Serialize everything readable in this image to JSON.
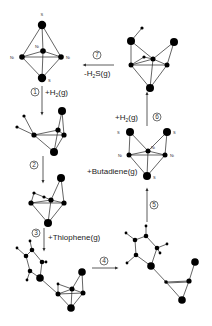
{
  "diagram": {
    "colors": {
      "atom": "#000000",
      "bond": "#222222",
      "text": "#222222",
      "background": "#ffffff"
    },
    "steps": [
      {
        "id": 1,
        "number": "1",
        "reagent": "+H",
        "sub": "2",
        "suffix": "(g)",
        "direction": "down"
      },
      {
        "id": 2,
        "number": "2",
        "reagent": "",
        "sub": "",
        "suffix": "",
        "direction": "down"
      },
      {
        "id": 3,
        "number": "3",
        "reagent": "+Thiophene(g)",
        "sub": "",
        "suffix": "",
        "direction": "down"
      },
      {
        "id": 4,
        "number": "4",
        "reagent": "",
        "sub": "",
        "suffix": "",
        "direction": "right"
      },
      {
        "id": 5,
        "number": "5",
        "reagent": "",
        "sub": "",
        "suffix": "",
        "direction": "up"
      },
      {
        "id": 6,
        "number": "6",
        "reagent": "+H",
        "sub": "2",
        "suffix": "(g)",
        "direction": "up"
      },
      {
        "id": 7,
        "number": "7",
        "reagent": "-H",
        "sub": "2",
        "suffix": "S(g)",
        "direction": "left"
      }
    ],
    "side_label": {
      "text": "+Butadiene(g)"
    },
    "structures": [
      {
        "name": "Ni3S2 initial cluster",
        "atom_labels": [
          "S",
          "Ni",
          "Ni",
          "Ni",
          "S"
        ]
      },
      {
        "name": "Ni3S2 with H2 adsorbed (after step 1)",
        "atom_labels": []
      },
      {
        "name": "Ni3S2 with dissociated H (after step 2)",
        "atom_labels": []
      },
      {
        "name": "Thiophene adsorbed on cluster (after step 3)",
        "atom_labels": []
      },
      {
        "name": "Thiophene ring opening (after step 4)",
        "atom_labels": []
      },
      {
        "name": "Ni3S3 cluster after butadiene release",
        "atom_labels": [
          "S",
          "S",
          "Ni",
          "Ni",
          "Ni",
          "S"
        ]
      },
      {
        "name": "Ni3S3 with H2 adsorbed (after step 6)",
        "atom_labels": []
      }
    ]
  }
}
